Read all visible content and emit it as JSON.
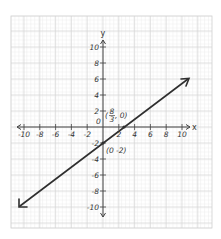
{
  "chart_data": {
    "type": "line",
    "title": "",
    "xlabel": "x",
    "ylabel": "y",
    "xlim": [
      -10,
      10
    ],
    "ylim": [
      -10,
      10
    ],
    "grid": true,
    "x_ticks": [
      -10,
      -8,
      -6,
      -4,
      -2,
      2,
      4,
      6,
      8,
      10
    ],
    "y_ticks": [
      10,
      8,
      6,
      4,
      2,
      -2,
      -4,
      -6,
      -8,
      -10
    ],
    "origin_label": "0",
    "series": [
      {
        "name": "y = (3/4)x - 2",
        "x": [
          -10.5,
          10.5
        ],
        "y": [
          -9.875,
          5.875
        ],
        "arrows": "both"
      }
    ],
    "annotations": [
      {
        "point": [
          2.667,
          0
        ],
        "label": "(8/3, 0)",
        "numerator": "8",
        "denominator": "3"
      },
      {
        "point": [
          0,
          -2
        ],
        "label": "(0 -2)"
      }
    ],
    "colors": {
      "grid_minor": "#e4e4e4",
      "grid_major": "#cfcfcf",
      "axis": "#444444",
      "line": "#2f2f2f"
    }
  },
  "labels": {
    "x_axis": "x",
    "y_axis": "y",
    "origin": "0",
    "x_intercept_open": "(",
    "x_intercept_num": "8",
    "x_intercept_den": "3",
    "x_intercept_close": ", 0)",
    "y_intercept": "(0 -2)",
    "xt": [
      "-10",
      "-8",
      "-6",
      "-4",
      "-2",
      "2",
      "4",
      "6",
      "8",
      "10"
    ],
    "yt": [
      "10",
      "8",
      "6",
      "4",
      "2",
      "-2",
      "-4",
      "-6",
      "-8",
      "-10"
    ]
  }
}
